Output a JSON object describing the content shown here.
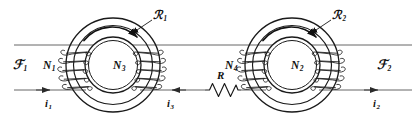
{
  "figure": {
    "kind": "magnetic-circuit-diagram",
    "stroke_color": "#1a1a1a",
    "wire_color": "#555555",
    "background": "#ffffff"
  },
  "labels": {
    "mmf_left": {
      "symbol": "ℱ",
      "sub": "1",
      "name": "mmf-source-1"
    },
    "mmf_right": {
      "symbol": "ℱ",
      "sub": "2",
      "name": "mmf-source-2"
    },
    "reluctance_left": {
      "symbol": "ℛ",
      "sub": "1",
      "name": "reluctance-1"
    },
    "reluctance_right": {
      "symbol": "ℛ",
      "sub": "2",
      "name": "reluctance-2"
    },
    "winding_n1": {
      "symbol": "N",
      "sub": "1"
    },
    "winding_n3": {
      "symbol": "N",
      "sub": "3"
    },
    "winding_n4": {
      "symbol": "N",
      "sub": "4"
    },
    "winding_n2": {
      "symbol": "N",
      "sub": "2"
    },
    "current_i1": {
      "symbol": "i",
      "sub": "1"
    },
    "current_i3": {
      "symbol": "i",
      "sub": "3"
    },
    "current_i2": {
      "symbol": "i",
      "sub": "2"
    },
    "resistor": {
      "symbol": "R",
      "sub": ""
    }
  },
  "geometry": {
    "top_wire_y": 45,
    "bottom_wire_y": 90,
    "core_left_cx": 113,
    "core_right_cx": 292,
    "core_cy": 65,
    "core_outer_r": 47,
    "core_inner_r": 33,
    "bore_outer_r": 28,
    "bore_inner_r": 24
  },
  "arrows": {
    "i1_direction": "right",
    "i3_direction": "left",
    "i2_direction": "right",
    "flux_left_direction": "clockwise",
    "flux_right_direction": "clockwise"
  }
}
